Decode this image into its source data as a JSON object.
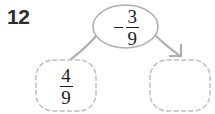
{
  "problem": {
    "number": "12",
    "type": "fraction-subtraction-flow"
  },
  "oval": {
    "name": "operation-oval",
    "sign": "−",
    "numerator": "3",
    "denominator": "9",
    "full_text": "−3/9"
  },
  "boxes": [
    {
      "name": "start-value-box",
      "position": "left",
      "filled": true,
      "numerator": "4",
      "denominator": "9",
      "full_text": "4/9"
    },
    {
      "name": "answer-box",
      "position": "right",
      "filled": false,
      "numerator": "",
      "denominator": "",
      "full_text": ""
    }
  ],
  "connectors": [
    {
      "name": "left-connector",
      "from": "operation-oval",
      "to": "start-value-box",
      "arrowhead": false
    },
    {
      "name": "right-connector",
      "from": "operation-oval",
      "to": "answer-box",
      "arrowhead": true
    }
  ],
  "colors": {
    "stroke": "#aeaeae",
    "dashed_stroke": "#bdbdbd",
    "text": "#1c1c1c",
    "number_label": "#2b2b2b",
    "background": "#ffffff"
  }
}
